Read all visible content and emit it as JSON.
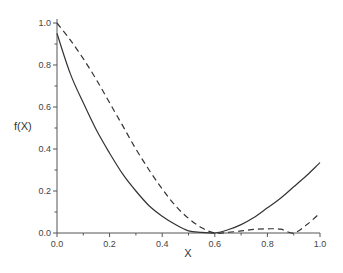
{
  "chart_data": {
    "type": "line",
    "title": "",
    "xlabel": "X",
    "ylabel": "f(X)",
    "xlim": [
      0,
      1.0
    ],
    "ylim": [
      0,
      1.0
    ],
    "grid": false,
    "legend": null,
    "x_ticks": [
      "0.0",
      "0.2",
      "0.4",
      "0.6",
      "0.8",
      "1.0"
    ],
    "y_ticks": [
      "0.0",
      "0.2",
      "0.4",
      "0.6",
      "0.8",
      "1.0"
    ],
    "series": [
      {
        "name": "solid",
        "style": "solid",
        "x": [
          0,
          0.05,
          0.1,
          0.15,
          0.2,
          0.25,
          0.3,
          0.35,
          0.4,
          0.45,
          0.5,
          0.55,
          0.6,
          0.65,
          0.7,
          0.75,
          0.8,
          0.85,
          0.9,
          0.95,
          1.0
        ],
        "values": [
          0.95,
          0.76,
          0.62,
          0.49,
          0.38,
          0.28,
          0.2,
          0.13,
          0.08,
          0.04,
          0.01,
          0.003,
          0.0,
          0.015,
          0.04,
          0.075,
          0.12,
          0.165,
          0.22,
          0.275,
          0.335
        ]
      },
      {
        "name": "dashed",
        "style": "dashed",
        "x": [
          0,
          0.05,
          0.1,
          0.15,
          0.2,
          0.25,
          0.3,
          0.35,
          0.4,
          0.45,
          0.5,
          0.55,
          0.6,
          0.65,
          0.7,
          0.75,
          0.8,
          0.85,
          0.9,
          0.95,
          1.0
        ],
        "values": [
          1.0,
          0.92,
          0.83,
          0.73,
          0.62,
          0.51,
          0.4,
          0.3,
          0.21,
          0.13,
          0.07,
          0.025,
          0.0,
          0.003,
          0.01,
          0.017,
          0.02,
          0.018,
          0.0,
          0.04,
          0.095
        ]
      }
    ]
  }
}
